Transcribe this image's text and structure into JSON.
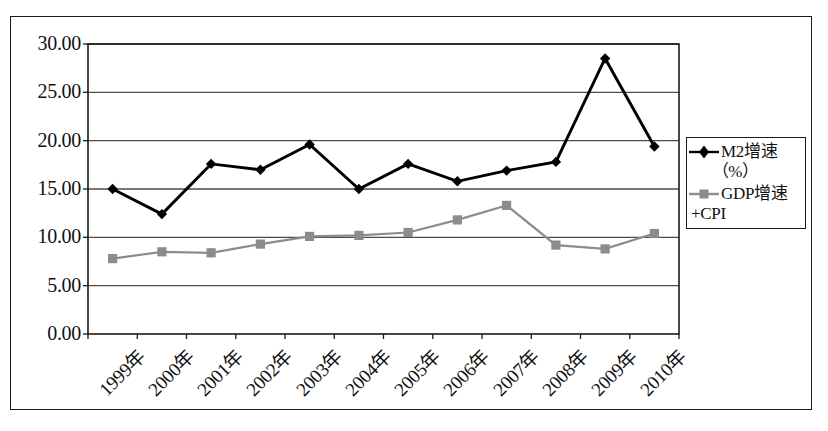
{
  "chart_data": {
    "type": "line",
    "title": "",
    "xlabel": "",
    "ylabel": "",
    "categories": [
      "1999年",
      "2000年",
      "2001年",
      "2002年",
      "2003年",
      "2004年",
      "2005年",
      "2006年",
      "2007年",
      "2008年",
      "2009年",
      "2010年"
    ],
    "ytick_labels": [
      "30.00",
      "25.00",
      "20.00",
      "15.00",
      "10.00",
      "5.00",
      "0.00"
    ],
    "ytick_values": [
      30,
      25,
      20,
      15,
      10,
      5,
      0
    ],
    "ylim": [
      0,
      30
    ],
    "grid": "horizontal",
    "legend_position": "right",
    "series": [
      {
        "name": "M2增速（%）",
        "legend_line1": "M2增速",
        "legend_line2": "（%）",
        "marker": "diamond",
        "color": "#000000",
        "values": [
          15.0,
          12.4,
          17.6,
          17.0,
          19.6,
          15.0,
          17.6,
          15.8,
          16.9,
          17.8,
          28.5,
          19.4
        ]
      },
      {
        "name": "GDP增速+CPI",
        "legend_line1": "GDP增速",
        "legend_line2": "+CPI",
        "marker": "square",
        "color": "#8c8c8c",
        "values": [
          7.8,
          8.5,
          8.4,
          9.3,
          10.1,
          10.2,
          10.5,
          11.8,
          13.3,
          9.2,
          8.8,
          10.4
        ]
      }
    ]
  },
  "colors": {
    "frame": "#1a1a1a",
    "gridline": "#4d4d4d",
    "series1": "#000000",
    "series2": "#8c8c8c",
    "background": "#ffffff"
  }
}
